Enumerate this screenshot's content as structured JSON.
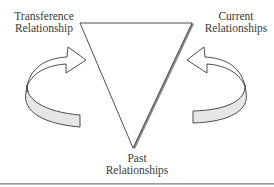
{
  "diagram": {
    "type": "triangle-of-relationships",
    "nodes": [
      {
        "id": "transference",
        "label_lines": [
          "Transference",
          "Relationship"
        ],
        "position": "top-left"
      },
      {
        "id": "current",
        "label_lines": [
          "Current",
          "Relationships"
        ],
        "position": "top-right"
      },
      {
        "id": "past",
        "label_lines": [
          "Past",
          "Relationships"
        ],
        "position": "bottom"
      }
    ],
    "arrows": [
      {
        "id": "left-arrow",
        "from": "past",
        "to": "transference",
        "style": "curved-3d",
        "direction": "clockwise-up"
      },
      {
        "id": "right-arrow",
        "from": "past",
        "to": "current",
        "style": "curved-3d",
        "direction": "counterclockwise-up"
      }
    ],
    "colors": {
      "stroke": "#3a3a3a",
      "arrow_fill": "#ffffff",
      "arrow_underside": "#e6e6e6",
      "shadow": "#8a8a8a"
    }
  }
}
